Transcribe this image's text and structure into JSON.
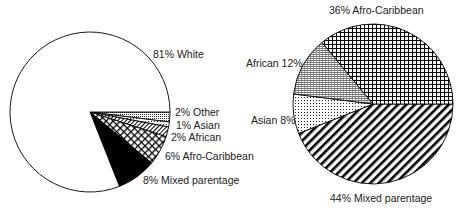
{
  "chart_data": [
    {
      "type": "pie",
      "title": "",
      "categories": [
        "White",
        "Other",
        "Asian",
        "African",
        "Afro-Caribbean",
        "Mixed parentage"
      ],
      "values": [
        81,
        2,
        1,
        2,
        6,
        8
      ],
      "labels": [
        "81% White",
        "2% Other",
        "1% Asian",
        "2% African",
        "6% Afro-Caribbean",
        "8% Mixed parentage"
      ]
    },
    {
      "type": "pie",
      "title": "",
      "categories": [
        "Afro-Caribbean",
        "African",
        "Asian",
        "Mixed parentage"
      ],
      "values": [
        36,
        12,
        8,
        44
      ],
      "labels": [
        "36% Afro-Caribbean",
        "African 12%",
        "Asian 8%",
        "44% Mixed parentage"
      ]
    }
  ]
}
